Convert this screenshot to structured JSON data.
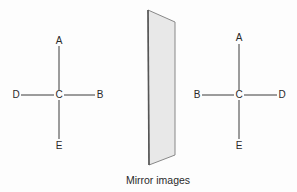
{
  "caption": "Mirror images",
  "colors": {
    "line": "#3a3a3a",
    "mirror_fill": "#e6e6e6",
    "mirror_edge_dark": "#555555",
    "mirror_edge_light": "#888888",
    "text": "#2a2a2a"
  },
  "left_figure": {
    "center": "C",
    "top": "A",
    "bottom": "E",
    "left": "D",
    "right": "B"
  },
  "mirror": {
    "label": "mirror"
  },
  "right_figure": {
    "center": "C",
    "top": "A",
    "bottom": "E",
    "left": "B",
    "right": "D"
  }
}
